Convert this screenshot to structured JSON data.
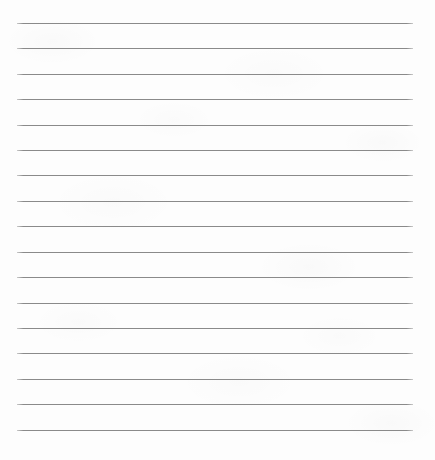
{
  "document": {
    "kind": "scanned-ruled-paper",
    "title": "",
    "body_text": "",
    "handwriting": "",
    "page_number": "",
    "notes": ""
  },
  "canvas": {
    "width": 435,
    "height": 460,
    "background_color": "#fdfdfd"
  },
  "ruling": {
    "line_color": "#8a8a8a",
    "line_thickness": 1,
    "line_count": 17,
    "left_x": 17,
    "right_x": 413,
    "line_length": 396,
    "first_line_y": 23,
    "spacing": 25.4,
    "line_y_positions": [
      23,
      48,
      74,
      99,
      125,
      150,
      175,
      201,
      226,
      252,
      277,
      303,
      328,
      353,
      379,
      404,
      430
    ],
    "margin_rule_vertical": false,
    "top_margin": 23,
    "bottom_margin": 30
  }
}
